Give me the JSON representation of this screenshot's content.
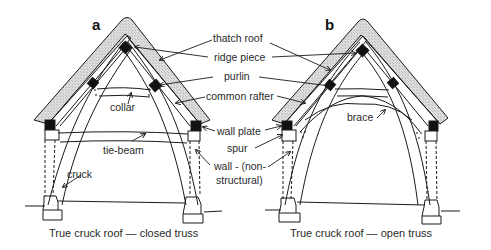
{
  "figure": {
    "panels": [
      {
        "letter": "a",
        "caption": "True cruck roof — closed truss",
        "local_labels": {
          "collar": "collar",
          "tie_beam": "tie-beam",
          "cruck": "cruck"
        }
      },
      {
        "letter": "b",
        "caption": "True cruck roof — open truss",
        "local_labels": {
          "brace": "brace"
        }
      }
    ],
    "shared_labels": {
      "thatch_roof": "thatch roof",
      "ridge_piece": "ridge piece",
      "purlin": "purlin",
      "common_rafter": "common rafter",
      "wall_plate": "wall plate",
      "spur": "spur",
      "wall_line1": "wall - (non-",
      "wall_line2": "structural)"
    },
    "colors": {
      "line": "#1a1a1a",
      "thatch_fill": "#d4d4d4",
      "timber_block": "#111111",
      "background": "#ffffff"
    }
  }
}
